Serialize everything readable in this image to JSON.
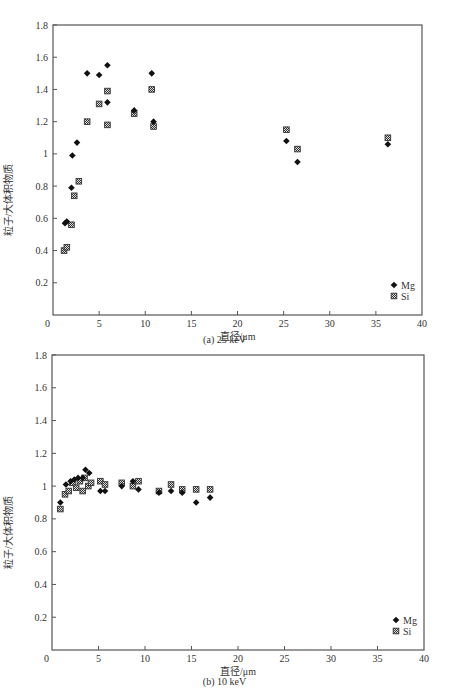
{
  "chart_data": [
    {
      "id": "a",
      "type": "scatter",
      "title": "",
      "caption": "(a) 25 keV",
      "xlabel": "直径/μm",
      "ylabel": "粒子/大体积物质",
      "xlim": [
        0,
        40
      ],
      "ylim": [
        0,
        1.8
      ],
      "xticks": [
        0,
        5,
        10,
        15,
        20,
        25,
        30,
        35,
        40
      ],
      "yticks": [
        0,
        0.2,
        0.4,
        0.6,
        0.8,
        1,
        1.2,
        1.4,
        1.6,
        1.8
      ],
      "ytick_labels": [
        "0",
        "0.2",
        "0.4",
        "0.6",
        "0.8",
        "1",
        "1.2",
        "1.4",
        "1.6",
        "1.8"
      ],
      "grid": false,
      "legend_position": "lower right",
      "series": [
        {
          "name": "Mg",
          "marker": "diamond-filled",
          "points": [
            [
              1.3,
              0.57
            ],
            [
              1.5,
              0.58
            ],
            [
              2.0,
              0.79
            ],
            [
              2.1,
              0.99
            ],
            [
              2.6,
              1.07
            ],
            [
              3.7,
              1.5
            ],
            [
              5.0,
              1.49
            ],
            [
              5.9,
              1.55
            ],
            [
              5.9,
              1.32
            ],
            [
              8.8,
              1.27
            ],
            [
              10.7,
              1.5
            ],
            [
              10.9,
              1.2
            ],
            [
              25.3,
              1.08
            ],
            [
              26.5,
              0.95
            ],
            [
              36.3,
              1.06
            ]
          ]
        },
        {
          "name": "Si",
          "marker": "square-hatched",
          "points": [
            [
              1.2,
              0.4
            ],
            [
              1.5,
              0.42
            ],
            [
              2.0,
              0.56
            ],
            [
              2.3,
              0.74
            ],
            [
              2.8,
              0.83
            ],
            [
              3.7,
              1.2
            ],
            [
              5.0,
              1.31
            ],
            [
              5.9,
              1.39
            ],
            [
              5.9,
              1.18
            ],
            [
              8.8,
              1.25
            ],
            [
              10.7,
              1.4
            ],
            [
              10.9,
              1.17
            ],
            [
              25.3,
              1.15
            ],
            [
              26.5,
              1.03
            ],
            [
              36.3,
              1.1
            ]
          ]
        }
      ]
    },
    {
      "id": "b",
      "type": "scatter",
      "title": "",
      "caption": "(b) 10 keV",
      "xlabel": "直径/μm",
      "ylabel": "粒子/大体积物质",
      "xlim": [
        0,
        40
      ],
      "ylim": [
        0,
        1.8
      ],
      "xticks": [
        0,
        5,
        10,
        15,
        20,
        25,
        30,
        35,
        40
      ],
      "yticks": [
        0,
        0.2,
        0.4,
        0.6,
        0.8,
        1,
        1.2,
        1.4,
        1.6,
        1.8
      ],
      "ytick_labels": [
        "0",
        "0.2",
        "0.4",
        "0.6",
        "0.8",
        "1",
        "1.2",
        "1.4",
        "1.6",
        "1.8"
      ],
      "grid": false,
      "legend_position": "lower right",
      "series": [
        {
          "name": "Mg",
          "marker": "diamond-filled",
          "points": [
            [
              0.9,
              0.9
            ],
            [
              1.5,
              1.01
            ],
            [
              2.0,
              1.03
            ],
            [
              2.4,
              1.04
            ],
            [
              2.8,
              1.05
            ],
            [
              3.3,
              1.05
            ],
            [
              3.6,
              1.1
            ],
            [
              4.0,
              1.08
            ],
            [
              5.2,
              0.97
            ],
            [
              5.7,
              0.97
            ],
            [
              7.5,
              1.0
            ],
            [
              8.7,
              1.03
            ],
            [
              9.3,
              0.98
            ],
            [
              11.5,
              0.96
            ],
            [
              12.8,
              0.97
            ],
            [
              14.0,
              0.96
            ],
            [
              15.5,
              0.9
            ],
            [
              17.0,
              0.93
            ]
          ]
        },
        {
          "name": "Si",
          "marker": "square-hatched",
          "points": [
            [
              0.9,
              0.86
            ],
            [
              1.4,
              0.95
            ],
            [
              1.8,
              0.97
            ],
            [
              2.2,
              1.02
            ],
            [
              2.6,
              0.99
            ],
            [
              3.0,
              1.03
            ],
            [
              3.3,
              0.97
            ],
            [
              3.5,
              1.05
            ],
            [
              3.9,
              1.0
            ],
            [
              4.2,
              1.02
            ],
            [
              5.2,
              1.03
            ],
            [
              5.7,
              1.01
            ],
            [
              7.5,
              1.02
            ],
            [
              8.7,
              1.0
            ],
            [
              9.3,
              1.03
            ],
            [
              11.5,
              0.97
            ],
            [
              12.8,
              1.01
            ],
            [
              14.0,
              0.98
            ],
            [
              15.5,
              0.98
            ],
            [
              17.0,
              0.98
            ]
          ]
        }
      ]
    }
  ]
}
